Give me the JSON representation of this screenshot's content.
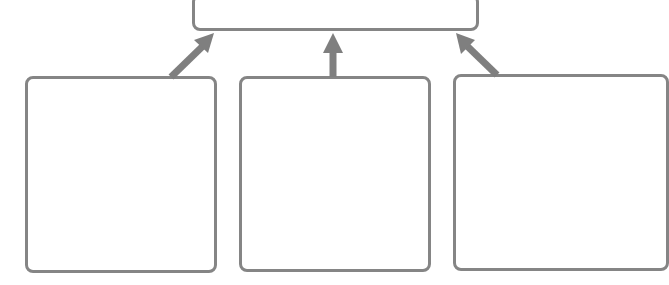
{
  "diagram": {
    "type": "hierarchy",
    "colors": {
      "border": "#858585",
      "arrow": "#7f7f7f",
      "fill": "#ffffff"
    },
    "top_box": {
      "label": ""
    },
    "bottom_boxes": [
      {
        "label": ""
      },
      {
        "label": ""
      },
      {
        "label": ""
      }
    ],
    "arrows": [
      {
        "from": "bottom_boxes.0",
        "to": "top_box"
      },
      {
        "from": "bottom_boxes.1",
        "to": "top_box"
      },
      {
        "from": "bottom_boxes.2",
        "to": "top_box"
      }
    ]
  }
}
